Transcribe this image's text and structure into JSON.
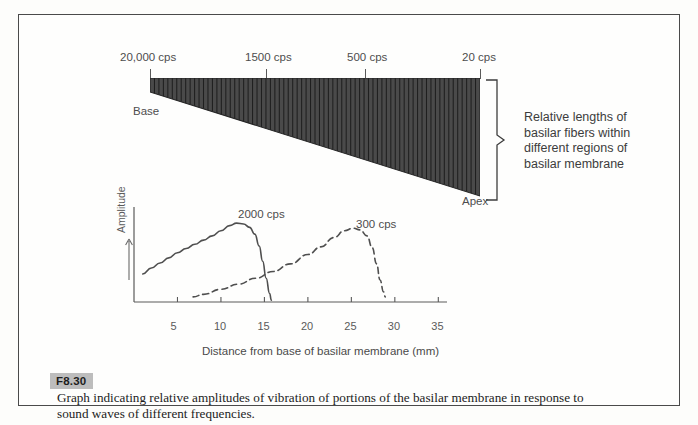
{
  "figure": {
    "number": "F8.30",
    "caption_line1": "Graph indicating relative amplitudes of vibration of  portions of the  basilar  membrane  in  response  to",
    "caption_line2": "sound waves of different frequencies."
  },
  "membrane": {
    "frequency_ticks": [
      {
        "label": "20,000 cps",
        "x_pct": 0
      },
      {
        "label": "1500 cps",
        "x_pct": 35
      },
      {
        "label": "500 cps",
        "x_pct": 65
      },
      {
        "label": "20 cps",
        "x_pct": 100
      }
    ],
    "base_label": "Base",
    "apex_label": "Apex",
    "bracket_text_lines": [
      "Relative lengths of",
      "basilar fibers within",
      "different regions of",
      "basilar membrane"
    ],
    "fiber_count": 74,
    "fill_color": "#4a4a4a",
    "stripe_color": "#1f1f1f"
  },
  "chart_data": {
    "type": "line",
    "title": "",
    "xlabel": "Distance from base of basilar membrane (mm)",
    "ylabel": "Amplitude",
    "xlim": [
      0,
      36
    ],
    "ylim": [
      0,
      1.12
    ],
    "xticks": [
      5,
      10,
      15,
      20,
      25,
      30,
      35
    ],
    "xtick_labels": [
      "5",
      "10",
      "15",
      "20",
      "25",
      "30",
      "35"
    ],
    "yticks": [],
    "grid": false,
    "legend": "inline-annotations",
    "series": [
      {
        "name": "2000 cps",
        "style": "solid",
        "color": "#4f4f4f",
        "annotation": "2000 cps",
        "peak_x": 12,
        "points": [
          [
            1.0,
            0.33
          ],
          [
            2.0,
            0.4
          ],
          [
            3.0,
            0.46
          ],
          [
            4.0,
            0.52
          ],
          [
            5.0,
            0.58
          ],
          [
            6.0,
            0.63
          ],
          [
            7.0,
            0.68
          ],
          [
            8.0,
            0.73
          ],
          [
            9.0,
            0.78
          ],
          [
            10.0,
            0.84
          ],
          [
            11.0,
            0.9
          ],
          [
            11.8,
            0.93
          ],
          [
            12.6,
            0.92
          ],
          [
            13.3,
            0.88
          ],
          [
            13.9,
            0.8
          ],
          [
            14.4,
            0.66
          ],
          [
            14.8,
            0.48
          ],
          [
            15.2,
            0.28
          ],
          [
            15.6,
            0.1
          ],
          [
            15.8,
            0.02
          ]
        ]
      },
      {
        "name": "300 cps",
        "style": "dashed",
        "color": "#4f4f4f",
        "annotation": "300 cps",
        "peak_x": 25,
        "points": [
          [
            6.8,
            0.06
          ],
          [
            8.0,
            0.09
          ],
          [
            10.0,
            0.15
          ],
          [
            12.0,
            0.21
          ],
          [
            14.0,
            0.28
          ],
          [
            16.0,
            0.36
          ],
          [
            18.0,
            0.45
          ],
          [
            20.0,
            0.56
          ],
          [
            21.5,
            0.65
          ],
          [
            23.0,
            0.76
          ],
          [
            24.2,
            0.84
          ],
          [
            25.2,
            0.87
          ],
          [
            26.0,
            0.85
          ],
          [
            26.8,
            0.78
          ],
          [
            27.4,
            0.64
          ],
          [
            27.9,
            0.45
          ],
          [
            28.3,
            0.26
          ],
          [
            28.7,
            0.12
          ],
          [
            28.9,
            0.06
          ]
        ]
      }
    ]
  }
}
